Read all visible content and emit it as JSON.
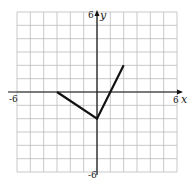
{
  "chart_data": {
    "type": "line",
    "title": "",
    "xlabel": "x",
    "ylabel": "y",
    "xlim": [
      -6,
      6
    ],
    "ylim": [
      -6,
      6
    ],
    "grid": true,
    "tick_labels": {
      "x_min": "-6",
      "x_max": "6",
      "y_min": "-6",
      "y_max": "6"
    },
    "series": [
      {
        "name": "piecewise",
        "points": [
          [
            -3,
            0
          ],
          [
            0,
            -2
          ],
          [
            2,
            2
          ]
        ]
      }
    ],
    "colors": {
      "line": "#111111",
      "grid": "#bbbbbb",
      "axis": "#111111"
    }
  }
}
